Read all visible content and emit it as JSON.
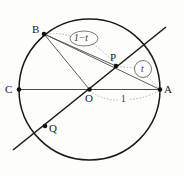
{
  "figure": {
    "background_color": "#fdfdfc",
    "stroke_color": "#1a1a1a",
    "thin_stroke_color": "#555555",
    "dotted_color": "#8a8a8a",
    "circle": {
      "cx": 89.5,
      "cy": 89.5,
      "r": 70.5
    },
    "points": [
      {
        "name": "A",
        "x": 160,
        "y": 89.5,
        "label": "A",
        "label_x": 164,
        "label_y": 85
      },
      {
        "name": "B",
        "x": 44,
        "y": 34,
        "label": "B",
        "label_x": 33,
        "label_y": 25
      },
      {
        "name": "C",
        "x": 19,
        "y": 89.5,
        "label": "C",
        "label_x": 6,
        "label_y": 85
      },
      {
        "name": "O",
        "x": 89.5,
        "y": 89.5,
        "label": "O",
        "label_x": 86,
        "label_y": 93
      },
      {
        "name": "P",
        "x": 116,
        "y": 66,
        "label": "P",
        "label_x": 111,
        "label_y": 53
      },
      {
        "name": "Q",
        "x": 45,
        "y": 126,
        "label": "Q",
        "label_x": 49,
        "label_y": 124
      }
    ],
    "segments": [
      {
        "name": "diameter-CA",
        "from": "C",
        "to": "A",
        "style": "thin"
      },
      {
        "name": "chord-BA",
        "from": "B",
        "to": "A",
        "style": "thin"
      },
      {
        "name": "segment-BO",
        "from": "B",
        "to": "O",
        "style": "thin"
      },
      {
        "name": "segment-BP",
        "from": "B",
        "to": "P",
        "style": "thin"
      },
      {
        "name": "secant-line-QPA",
        "from": "(13,150)",
        "to": "(166,27)",
        "style": "thick"
      }
    ],
    "annotations": [
      {
        "name": "one-minus-t",
        "text": "1−t",
        "shape": "ellipse",
        "cx": 84,
        "cy": 38.5,
        "rx": 14,
        "ry": 7.5,
        "leader_targets": [
          "B",
          "P"
        ]
      },
      {
        "name": "t",
        "text": "t",
        "shape": "circle",
        "cx": 143,
        "cy": 69,
        "rx": 8.5,
        "ry": 8.5,
        "leader_targets": [
          "P",
          "A"
        ]
      },
      {
        "name": "unit-length",
        "text": "1",
        "shape": "none",
        "cx": 124,
        "cy": 100,
        "leader_targets": [
          "O",
          "A"
        ]
      }
    ]
  }
}
